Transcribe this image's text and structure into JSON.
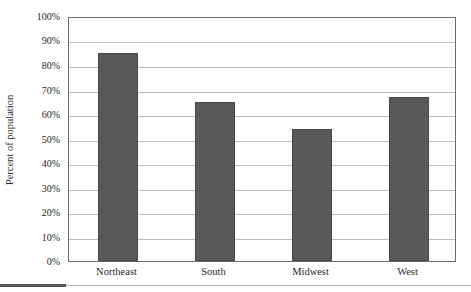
{
  "chart_data": {
    "type": "bar",
    "title": "",
    "xlabel": "",
    "ylabel": "Percent of population",
    "categories": [
      "Northeast",
      "South",
      "Midwest",
      "West"
    ],
    "values": [
      85,
      65,
      54,
      67
    ],
    "value_labels": [
      "85%",
      "65%",
      "54%",
      "67%"
    ],
    "ylim": [
      0,
      100
    ],
    "ytick_labels": [
      "100%",
      "90%",
      "80%",
      "70%",
      "60%",
      "50%",
      "40%",
      "30%",
      "20%",
      "10%",
      "0%"
    ],
    "ytick_values": [
      100,
      90,
      80,
      70,
      60,
      50,
      40,
      30,
      20,
      10,
      0
    ],
    "grid": true,
    "legend": false,
    "legend_position": "none",
    "series": [
      {
        "name": "Percent of population",
        "values": [
          85,
          65,
          54,
          67
        ]
      }
    ],
    "colors": {
      "bar_fill": "#595959",
      "bar_edge": "#4a4a4a",
      "gridline": "#bdbdbd",
      "axis": "#6b6b6b",
      "text": "#1f1f1f",
      "footer_rule_dark": "#555555",
      "footer_rule_light": "#b0b0b0"
    }
  },
  "figure": {
    "cut_off_title": ""
  }
}
